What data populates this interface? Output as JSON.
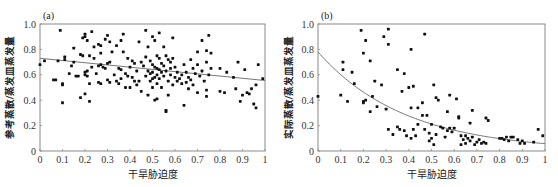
{
  "chart_data": [
    {
      "type": "scatter",
      "panel_label": "(a)",
      "title": "",
      "xlabel": "干旱胁迫度",
      "ylabel": "参考蒸散/蒸发皿蒸发量",
      "xlim": [
        0,
        1
      ],
      "ylim": [
        0,
        1.0
      ],
      "x_ticks": [
        "0",
        "0.1",
        "0.2",
        "0.3",
        "0.4",
        "0.5",
        "0.6",
        "0.7",
        "0.8",
        "0.9",
        "1"
      ],
      "y_ticks": [
        "0",
        "0.2",
        "0.4",
        "0.6",
        "0.8",
        "1.0"
      ],
      "grid": false,
      "legend": null,
      "trendline": {
        "type": "linear",
        "x": [
          0,
          1
        ],
        "y": [
          0.73,
          0.555
        ]
      },
      "points": [
        [
          0.0,
          0.68
        ],
        [
          0.02,
          0.71
        ],
        [
          0.06,
          0.56
        ],
        [
          0.07,
          0.56
        ],
        [
          0.08,
          0.71
        ],
        [
          0.09,
          0.95
        ],
        [
          0.1,
          0.38
        ],
        [
          0.1,
          0.52
        ],
        [
          0.1,
          0.53
        ],
        [
          0.11,
          0.74
        ],
        [
          0.11,
          0.72
        ],
        [
          0.13,
          0.61
        ],
        [
          0.14,
          0.67
        ],
        [
          0.15,
          0.81
        ],
        [
          0.15,
          0.7
        ],
        [
          0.16,
          0.59
        ],
        [
          0.17,
          0.59
        ],
        [
          0.18,
          0.76
        ],
        [
          0.18,
          0.42
        ],
        [
          0.19,
          0.89
        ],
        [
          0.19,
          0.75
        ],
        [
          0.2,
          0.92
        ],
        [
          0.2,
          0.9
        ],
        [
          0.2,
          0.62
        ],
        [
          0.2,
          0.6
        ],
        [
          0.2,
          0.45
        ],
        [
          0.21,
          0.87
        ],
        [
          0.21,
          0.63
        ],
        [
          0.21,
          0.59
        ],
        [
          0.22,
          0.75
        ],
        [
          0.22,
          0.39
        ],
        [
          0.22,
          0.53
        ],
        [
          0.23,
          0.94
        ],
        [
          0.23,
          0.66
        ],
        [
          0.24,
          0.82
        ],
        [
          0.24,
          0.73
        ],
        [
          0.25,
          0.61
        ],
        [
          0.26,
          0.84
        ],
        [
          0.26,
          0.67
        ],
        [
          0.26,
          0.54
        ],
        [
          0.27,
          0.83
        ],
        [
          0.27,
          0.77
        ],
        [
          0.27,
          0.68
        ],
        [
          0.27,
          0.53
        ],
        [
          0.28,
          0.66
        ],
        [
          0.29,
          0.88
        ],
        [
          0.29,
          0.65
        ],
        [
          0.3,
          0.91
        ],
        [
          0.3,
          0.69
        ],
        [
          0.3,
          0.56
        ],
        [
          0.31,
          0.86
        ],
        [
          0.31,
          0.7
        ],
        [
          0.31,
          0.54
        ],
        [
          0.32,
          0.78
        ],
        [
          0.33,
          0.6
        ],
        [
          0.34,
          0.83
        ],
        [
          0.34,
          0.55
        ],
        [
          0.35,
          0.65
        ],
        [
          0.35,
          0.53
        ],
        [
          0.36,
          0.87
        ],
        [
          0.36,
          0.64
        ],
        [
          0.36,
          0.57
        ],
        [
          0.37,
          0.92
        ],
        [
          0.37,
          0.78
        ],
        [
          0.38,
          0.61
        ],
        [
          0.38,
          0.5
        ],
        [
          0.39,
          0.73
        ],
        [
          0.39,
          0.59
        ],
        [
          0.4,
          0.66
        ],
        [
          0.4,
          0.5
        ],
        [
          0.41,
          0.71
        ],
        [
          0.41,
          0.58
        ],
        [
          0.42,
          0.55
        ],
        [
          0.42,
          0.69
        ],
        [
          0.43,
          0.63
        ],
        [
          0.43,
          0.52
        ],
        [
          0.44,
          0.86
        ],
        [
          0.44,
          0.55
        ],
        [
          0.45,
          0.7
        ],
        [
          0.45,
          0.47
        ],
        [
          0.46,
          0.67
        ],
        [
          0.47,
          0.59
        ],
        [
          0.47,
          0.95
        ],
        [
          0.47,
          0.74
        ],
        [
          0.48,
          0.82
        ],
        [
          0.48,
          0.63
        ],
        [
          0.48,
          0.44
        ],
        [
          0.49,
          0.71
        ],
        [
          0.49,
          0.61
        ],
        [
          0.49,
          0.55
        ],
        [
          0.5,
          0.9
        ],
        [
          0.5,
          0.68
        ],
        [
          0.5,
          0.62
        ],
        [
          0.5,
          0.57
        ],
        [
          0.5,
          0.5
        ],
        [
          0.51,
          0.87
        ],
        [
          0.51,
          0.66
        ],
        [
          0.51,
          0.58
        ],
        [
          0.51,
          0.4
        ],
        [
          0.52,
          0.75
        ],
        [
          0.52,
          0.65
        ],
        [
          0.52,
          0.6
        ],
        [
          0.52,
          0.53
        ],
        [
          0.52,
          0.41
        ],
        [
          0.53,
          0.93
        ],
        [
          0.53,
          0.73
        ],
        [
          0.53,
          0.64
        ],
        [
          0.53,
          0.57
        ],
        [
          0.54,
          0.69
        ],
        [
          0.54,
          0.62
        ],
        [
          0.54,
          0.5
        ],
        [
          0.55,
          0.82
        ],
        [
          0.55,
          0.67
        ],
        [
          0.55,
          0.59
        ],
        [
          0.56,
          0.32
        ],
        [
          0.56,
          0.31
        ],
        [
          0.56,
          0.75
        ],
        [
          0.56,
          0.63
        ],
        [
          0.57,
          0.72
        ],
        [
          0.57,
          0.55
        ],
        [
          0.57,
          0.44
        ],
        [
          0.58,
          0.7
        ],
        [
          0.58,
          0.65
        ],
        [
          0.58,
          0.6
        ],
        [
          0.59,
          0.89
        ],
        [
          0.59,
          0.73
        ],
        [
          0.59,
          0.52
        ],
        [
          0.6,
          0.66
        ],
        [
          0.6,
          0.58
        ],
        [
          0.61,
          0.62
        ],
        [
          0.61,
          0.55
        ],
        [
          0.62,
          0.57
        ],
        [
          0.63,
          0.53
        ],
        [
          0.63,
          0.6
        ],
        [
          0.64,
          0.68
        ],
        [
          0.64,
          0.36
        ],
        [
          0.65,
          0.54
        ],
        [
          0.65,
          0.62
        ],
        [
          0.66,
          0.49
        ],
        [
          0.66,
          0.58
        ],
        [
          0.67,
          0.72
        ],
        [
          0.67,
          0.56
        ],
        [
          0.68,
          0.65
        ],
        [
          0.68,
          0.52
        ],
        [
          0.69,
          0.61
        ],
        [
          0.7,
          0.78
        ],
        [
          0.7,
          0.46
        ],
        [
          0.7,
          0.68
        ],
        [
          0.71,
          0.59
        ],
        [
          0.72,
          0.87
        ],
        [
          0.72,
          0.63
        ],
        [
          0.73,
          0.55
        ],
        [
          0.74,
          0.79
        ],
        [
          0.74,
          0.7
        ],
        [
          0.74,
          0.48
        ],
        [
          0.74,
          0.43
        ],
        [
          0.75,
          0.91
        ],
        [
          0.75,
          0.6
        ],
        [
          0.76,
          0.77
        ],
        [
          0.76,
          0.65
        ],
        [
          0.8,
          0.65
        ],
        [
          0.8,
          0.47
        ],
        [
          0.82,
          0.46
        ],
        [
          0.83,
          0.62
        ],
        [
          0.86,
          0.58
        ],
        [
          0.87,
          0.49
        ],
        [
          0.88,
          0.7
        ],
        [
          0.89,
          0.39
        ],
        [
          0.9,
          0.44
        ],
        [
          0.91,
          0.64
        ],
        [
          0.92,
          0.46
        ],
        [
          0.93,
          0.45
        ],
        [
          0.94,
          0.49
        ],
        [
          0.95,
          0.37
        ],
        [
          0.96,
          0.34
        ],
        [
          0.96,
          0.52
        ],
        [
          0.97,
          0.68
        ],
        [
          0.99,
          0.57
        ]
      ]
    },
    {
      "type": "scatter",
      "panel_label": "(b)",
      "title": "",
      "xlabel": "干旱胁迫度",
      "ylabel": "实际蒸散/蒸发皿蒸发量",
      "xlim": [
        0,
        1
      ],
      "ylim": [
        0,
        1.0
      ],
      "x_ticks": [
        "0",
        "0.1",
        "0.2",
        "0.3",
        "0.4",
        "0.5",
        "0.6",
        "0.7",
        "0.8",
        "0.9",
        "1"
      ],
      "y_ticks": [
        "0",
        "0.2",
        "0.4",
        "0.6",
        "0.8",
        "1.0"
      ],
      "grid": false,
      "legend": null,
      "trendline": {
        "type": "exponential",
        "a": 0.78,
        "b": -2.6,
        "formula": "y = a*exp(b*x)"
      },
      "points": [
        [
          0.0,
          0.43
        ],
        [
          0.1,
          0.44
        ],
        [
          0.11,
          0.7
        ],
        [
          0.11,
          0.64
        ],
        [
          0.13,
          0.39
        ],
        [
          0.15,
          0.62
        ],
        [
          0.16,
          0.53
        ],
        [
          0.19,
          0.95
        ],
        [
          0.2,
          0.77
        ],
        [
          0.2,
          0.39
        ],
        [
          0.2,
          0.38
        ],
        [
          0.21,
          0.87
        ],
        [
          0.21,
          0.4
        ],
        [
          0.23,
          0.71
        ],
        [
          0.23,
          0.31
        ],
        [
          0.24,
          0.43
        ],
        [
          0.25,
          0.55
        ],
        [
          0.26,
          0.35
        ],
        [
          0.28,
          0.52
        ],
        [
          0.29,
          0.9
        ],
        [
          0.3,
          0.33
        ],
        [
          0.31,
          0.84
        ],
        [
          0.31,
          0.96
        ],
        [
          0.31,
          0.17
        ],
        [
          0.33,
          0.13
        ],
        [
          0.35,
          0.64
        ],
        [
          0.35,
          0.19
        ],
        [
          0.36,
          0.17
        ],
        [
          0.37,
          0.47
        ],
        [
          0.38,
          0.61
        ],
        [
          0.38,
          0.16
        ],
        [
          0.39,
          0.12
        ],
        [
          0.4,
          0.5
        ],
        [
          0.41,
          0.8
        ],
        [
          0.41,
          0.34
        ],
        [
          0.41,
          0.1
        ],
        [
          0.42,
          0.51
        ],
        [
          0.42,
          0.17
        ],
        [
          0.43,
          0.12
        ],
        [
          0.44,
          0.21
        ],
        [
          0.44,
          0.34
        ],
        [
          0.46,
          0.38
        ],
        [
          0.46,
          0.28
        ],
        [
          0.47,
          0.92
        ],
        [
          0.47,
          0.17
        ],
        [
          0.48,
          0.28
        ],
        [
          0.49,
          0.14
        ],
        [
          0.49,
          0.08
        ],
        [
          0.5,
          0.1
        ],
        [
          0.5,
          0.21
        ],
        [
          0.51,
          0.52
        ],
        [
          0.51,
          0.05
        ],
        [
          0.52,
          0.42
        ],
        [
          0.52,
          0.13
        ],
        [
          0.53,
          0.4
        ],
        [
          0.54,
          0.19
        ],
        [
          0.55,
          0.18
        ],
        [
          0.56,
          0.11
        ],
        [
          0.57,
          0.31
        ],
        [
          0.57,
          0.16
        ],
        [
          0.58,
          0.44
        ],
        [
          0.58,
          0.18
        ],
        [
          0.59,
          0.15
        ],
        [
          0.6,
          0.18
        ],
        [
          0.61,
          0.41
        ],
        [
          0.62,
          0.27
        ],
        [
          0.62,
          0.26
        ],
        [
          0.63,
          0.12
        ],
        [
          0.63,
          0.05
        ],
        [
          0.64,
          0.09
        ],
        [
          0.65,
          0.12
        ],
        [
          0.65,
          0.06
        ],
        [
          0.66,
          0.1
        ],
        [
          0.67,
          0.08
        ],
        [
          0.67,
          0.22
        ],
        [
          0.68,
          0.32
        ],
        [
          0.68,
          0.11
        ],
        [
          0.69,
          0.05
        ],
        [
          0.7,
          0.07
        ],
        [
          0.71,
          0.09
        ],
        [
          0.72,
          0.06
        ],
        [
          0.73,
          0.07
        ],
        [
          0.74,
          0.26
        ],
        [
          0.74,
          0.06
        ],
        [
          0.75,
          0.24
        ],
        [
          0.8,
          0.1
        ],
        [
          0.81,
          0.1
        ],
        [
          0.82,
          0.09
        ],
        [
          0.83,
          0.11
        ],
        [
          0.84,
          0.08
        ],
        [
          0.85,
          0.11
        ],
        [
          0.86,
          0.11
        ],
        [
          0.88,
          0.09
        ],
        [
          0.89,
          0.06
        ],
        [
          0.9,
          0.08
        ],
        [
          0.91,
          0.06
        ],
        [
          0.95,
          0.07
        ],
        [
          0.97,
          0.17
        ],
        [
          0.99,
          0.12
        ]
      ]
    }
  ]
}
